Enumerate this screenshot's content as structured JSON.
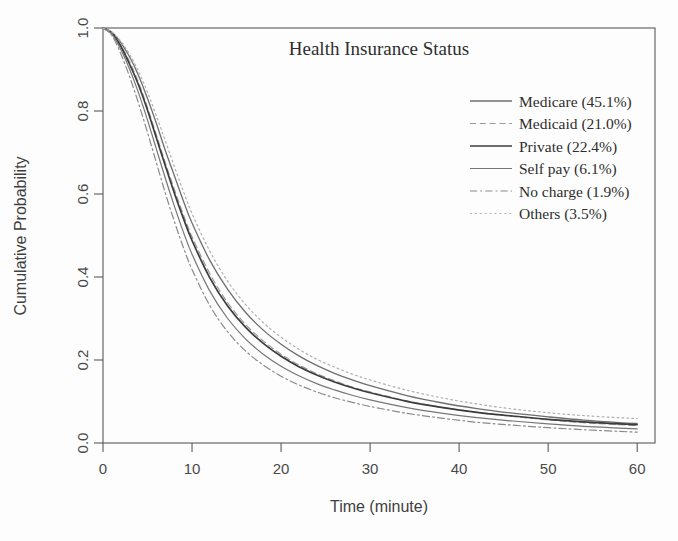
{
  "chart_data": {
    "type": "line",
    "title": "Health Insurance Status",
    "xlabel": "Time (minute)",
    "ylabel": "Cumulative Probability",
    "xlim": [
      0,
      62
    ],
    "ylim": [
      0.0,
      1.0
    ],
    "grid": false,
    "legend_position": "top-right",
    "xticks": [
      "0",
      "10",
      "20",
      "30",
      "40",
      "50",
      "60"
    ],
    "xtick_values": [
      0,
      10,
      20,
      30,
      40,
      50,
      60
    ],
    "yticks": [
      "0.0",
      "0.2",
      "0.4",
      "0.6",
      "0.8",
      "1.0"
    ],
    "ytick_values": [
      0.0,
      0.2,
      0.4,
      0.6,
      0.8,
      1.0
    ],
    "x": [
      0,
      1,
      2,
      3,
      4,
      5,
      6,
      7,
      8,
      9,
      10,
      12,
      14,
      16,
      18,
      20,
      22,
      24,
      26,
      28,
      30,
      34,
      38,
      42,
      46,
      50,
      54,
      58,
      60
    ],
    "series": [
      {
        "name": "Medicare",
        "label": "Medicare (45.1%)",
        "percent": "45.1%",
        "color": "#6e6e6e",
        "dash": "none",
        "width": 1.3,
        "values": [
          1.0,
          0.99,
          0.965,
          0.93,
          0.885,
          0.83,
          0.77,
          0.705,
          0.645,
          0.585,
          0.53,
          0.44,
          0.37,
          0.315,
          0.272,
          0.238,
          0.21,
          0.187,
          0.168,
          0.152,
          0.138,
          0.115,
          0.097,
          0.083,
          0.072,
          0.063,
          0.055,
          0.049,
          0.047
        ]
      },
      {
        "name": "Medicaid",
        "label": "Medicaid (21.0%)",
        "percent": "21.0%",
        "color": "#9a9a9a",
        "dash": "dashed",
        "width": 1.2,
        "values": [
          1.0,
          0.988,
          0.958,
          0.918,
          0.868,
          0.808,
          0.742,
          0.675,
          0.612,
          0.552,
          0.497,
          0.408,
          0.338,
          0.286,
          0.246,
          0.214,
          0.188,
          0.167,
          0.15,
          0.135,
          0.123,
          0.102,
          0.086,
          0.074,
          0.064,
          0.056,
          0.049,
          0.044,
          0.042
        ]
      },
      {
        "name": "Private",
        "label": "Private (22.4%)",
        "percent": "22.4%",
        "color": "#3c3c3c",
        "dash": "none",
        "width": 1.7,
        "values": [
          1.0,
          0.988,
          0.956,
          0.912,
          0.862,
          0.802,
          0.735,
          0.668,
          0.603,
          0.543,
          0.488,
          0.398,
          0.33,
          0.279,
          0.24,
          0.209,
          0.184,
          0.164,
          0.147,
          0.133,
          0.121,
          0.101,
          0.086,
          0.074,
          0.065,
          0.057,
          0.051,
          0.046,
          0.044
        ]
      },
      {
        "name": "Self pay",
        "label": "Self pay (6.1%)",
        "percent": "6.1%",
        "color": "#767676",
        "dash": "none",
        "width": 1.2,
        "values": [
          1.0,
          0.985,
          0.948,
          0.9,
          0.843,
          0.778,
          0.708,
          0.638,
          0.572,
          0.51,
          0.455,
          0.366,
          0.3,
          0.251,
          0.214,
          0.185,
          0.162,
          0.143,
          0.128,
          0.115,
          0.104,
          0.086,
          0.072,
          0.061,
          0.053,
          0.046,
          0.04,
          0.036,
          0.034
        ]
      },
      {
        "name": "No charge",
        "label": "No charge (1.9%)",
        "percent": "1.9%",
        "color": "#8a8a8a",
        "dash": "dash-dot",
        "width": 1.2,
        "values": [
          1.0,
          0.982,
          0.938,
          0.882,
          0.818,
          0.748,
          0.675,
          0.602,
          0.535,
          0.473,
          0.418,
          0.331,
          0.268,
          0.222,
          0.188,
          0.161,
          0.14,
          0.123,
          0.109,
          0.098,
          0.088,
          0.072,
          0.06,
          0.05,
          0.043,
          0.037,
          0.032,
          0.028,
          0.026
        ]
      },
      {
        "name": "Others",
        "label": "Others (3.5%)",
        "percent": "3.5%",
        "color": "#b0b0b0",
        "dash": "dotted",
        "width": 1.2,
        "values": [
          1.0,
          0.99,
          0.968,
          0.936,
          0.895,
          0.845,
          0.788,
          0.728,
          0.667,
          0.608,
          0.553,
          0.462,
          0.39,
          0.334,
          0.29,
          0.255,
          0.226,
          0.202,
          0.183,
          0.166,
          0.152,
          0.128,
          0.109,
          0.094,
          0.082,
          0.073,
          0.066,
          0.061,
          0.059
        ]
      }
    ]
  },
  "legend": {
    "entries": [
      "Medicare (45.1%)",
      "Medicaid (21.0%)",
      "Private (22.4%)",
      "Self pay (6.1%)",
      "No charge (1.9%)",
      "Others (3.5%)"
    ]
  }
}
